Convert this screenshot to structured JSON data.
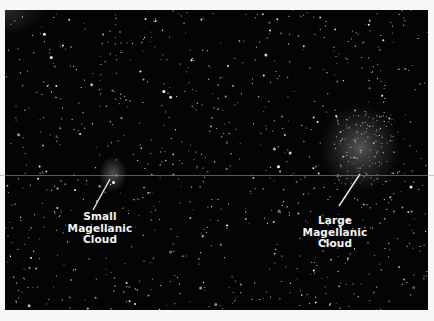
{
  "image": {
    "description": "Night-sky star field showing the Small and Large Magellanic Clouds",
    "background_color": "#040404"
  },
  "labels": {
    "small": {
      "lines": [
        "Small",
        "Magellanic",
        "Cloud"
      ]
    },
    "large": {
      "lines": [
        "Large",
        "Magellanic",
        "Cloud"
      ]
    }
  },
  "colors": {
    "label_text": "#f2f2f2",
    "pointer_line": "#e8e8e8",
    "page_background": "#f7f7f7"
  }
}
